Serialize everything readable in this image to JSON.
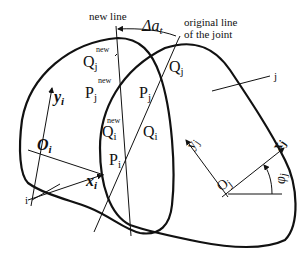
{
  "diagram": {
    "colors": {
      "stroke": "#111111",
      "background": "#ffffff"
    },
    "labels": {
      "new_line": "new line",
      "delta_a": "Δa",
      "delta_a_sub": "t",
      "original_line_1": "original line",
      "original_line_2": "of the joint",
      "Qj_new": "Q",
      "Qj_new_sub": "j",
      "Qj_new_sup": "new",
      "Pj_new": "P",
      "Pj_new_sub": "j",
      "Pj_new_sup": "new",
      "Pj": "P",
      "Pj_sub": "j",
      "Qj": "Q",
      "Qj_sub": "j",
      "Qi_new": "Q",
      "Qi_new_sub": "i",
      "Qi_new_sup": "new",
      "Qi": "Q",
      "Qi_sub": "i",
      "Pi": "P",
      "Pi_sub": "i",
      "yi": "y",
      "yi_sub": "i",
      "Oi": "O",
      "Oi_sub": "i",
      "xi": "x",
      "xi_sub": "i",
      "block_i": "i",
      "block_j": "j",
      "yj": "y",
      "yj_sub": "j",
      "Oj": "O",
      "Oj_sub": "j",
      "xj": "x",
      "xj_sub": "j",
      "phi_j": "φ",
      "phi_j_sub": "j"
    }
  }
}
